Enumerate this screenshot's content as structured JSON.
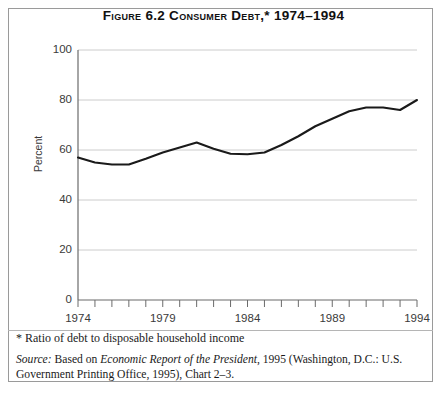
{
  "figure": {
    "title": "Figure 6.2  Consumer Debt,* 1974–1994",
    "footnote": "* Ratio of debt to disposable household income",
    "source_prefix": "Source:",
    "source_text_1": " Based on ",
    "source_italic": "Economic Report of the President",
    "source_text_2": ", 1995 (Washington, D.C.: U.S. Government Printing Office, 1995),  Chart 2–3."
  },
  "chart_data": {
    "type": "line",
    "title": "Figure 6.2  Consumer Debt,* 1974–1994",
    "xlabel": "",
    "ylabel": "Percent",
    "xlim": [
      1974,
      1994
    ],
    "ylim": [
      0,
      100
    ],
    "ytick_labels": [
      "0",
      "20",
      "40",
      "60",
      "80",
      "100"
    ],
    "ytick_values": [
      0,
      20,
      40,
      60,
      80,
      100
    ],
    "xtick_labels": [
      "1974",
      "1979",
      "1984",
      "1989",
      "1994"
    ],
    "xtick_values": [
      1974,
      1979,
      1984,
      1989,
      1994
    ],
    "minor_xticks_every": 1,
    "grid": "horizontal",
    "legend": "none",
    "series": [
      {
        "name": "Consumer debt as percent of disposable household income",
        "x": [
          1974,
          1975,
          1976,
          1977,
          1978,
          1979,
          1980,
          1981,
          1982,
          1983,
          1984,
          1985,
          1986,
          1987,
          1988,
          1989,
          1990,
          1991,
          1992,
          1993,
          1994
        ],
        "values": [
          57.0,
          55.0,
          54.2,
          54.2,
          56.5,
          59.0,
          61.0,
          63.0,
          60.5,
          58.5,
          58.3,
          59.0,
          62.0,
          65.5,
          69.5,
          72.5,
          75.5,
          77.0,
          77.0,
          76.0,
          80.0
        ]
      }
    ]
  }
}
